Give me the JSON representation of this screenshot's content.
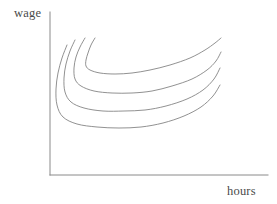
{
  "figure": {
    "background_color": "#ffffff",
    "width": 277,
    "height": 204
  },
  "axes": {
    "line_color": "#8a8a8a",
    "origin": [
      50,
      175
    ],
    "y_axis_top": [
      50,
      12
    ],
    "x_axis_right": [
      268,
      175
    ],
    "y_label": "wage",
    "x_label": "hours"
  },
  "chart_data": {
    "type": "line",
    "title": "",
    "xlabel": "hours",
    "ylabel": "wage",
    "grid": false,
    "legend": null,
    "legend_position": "none",
    "axis_ticks": [],
    "xlim": [
      50,
      268
    ],
    "ylim": [
      175,
      12
    ],
    "note": "Four convex (U-shaped) labor-supply indifference curves in wage-hours space; pixel coordinates, y measured downward from top of image.",
    "series": [
      {
        "name": "indifference-curve-1",
        "description": "highest curve, minimum near hours=150 wage-level y=68",
        "color": "#7d7d7d",
        "points": [
          [
            95,
            38
          ],
          [
            91,
            45
          ],
          [
            88,
            53
          ],
          [
            86,
            60
          ],
          [
            86,
            66
          ],
          [
            90,
            70
          ],
          [
            100,
            73
          ],
          [
            115,
            74
          ],
          [
            132,
            73
          ],
          [
            150,
            70
          ],
          [
            170,
            65
          ],
          [
            190,
            58
          ],
          [
            205,
            50
          ],
          [
            215,
            43
          ],
          [
            221,
            38
          ]
        ]
      },
      {
        "name": "indifference-curve-2",
        "description": "second curve, minimum near hours=145 wage-level y=88",
        "color": "#7d7d7d",
        "points": [
          [
            85,
            38
          ],
          [
            80,
            47
          ],
          [
            76,
            57
          ],
          [
            74,
            68
          ],
          [
            75,
            79
          ],
          [
            81,
            86
          ],
          [
            94,
            91
          ],
          [
            112,
            93
          ],
          [
            132,
            93
          ],
          [
            152,
            91
          ],
          [
            172,
            86
          ],
          [
            192,
            79
          ],
          [
            207,
            70
          ],
          [
            216,
            61
          ],
          [
            221,
            52
          ]
        ]
      },
      {
        "name": "indifference-curve-3",
        "description": "third curve, minimum near hours=140 wage-level y=105",
        "color": "#7d7d7d",
        "points": [
          [
            75,
            40
          ],
          [
            70,
            51
          ],
          [
            66,
            64
          ],
          [
            64,
            78
          ],
          [
            65,
            92
          ],
          [
            71,
            102
          ],
          [
            84,
            108
          ],
          [
            103,
            111
          ],
          [
            124,
            111
          ],
          [
            145,
            110
          ],
          [
            166,
            106
          ],
          [
            187,
            99
          ],
          [
            203,
            90
          ],
          [
            214,
            79
          ],
          [
            220,
            68
          ]
        ]
      },
      {
        "name": "indifference-curve-4",
        "description": "lowest curve, minimum near hours=135 wage-level y=123",
        "color": "#7d7d7d",
        "points": [
          [
            67,
            45
          ],
          [
            62,
            58
          ],
          [
            58,
            73
          ],
          [
            56,
            89
          ],
          [
            57,
            105
          ],
          [
            63,
            117
          ],
          [
            77,
            124
          ],
          [
            97,
            127
          ],
          [
            119,
            128
          ],
          [
            141,
            127
          ],
          [
            163,
            123
          ],
          [
            184,
            116
          ],
          [
            201,
            107
          ],
          [
            213,
            96
          ],
          [
            220,
            85
          ]
        ]
      }
    ]
  }
}
